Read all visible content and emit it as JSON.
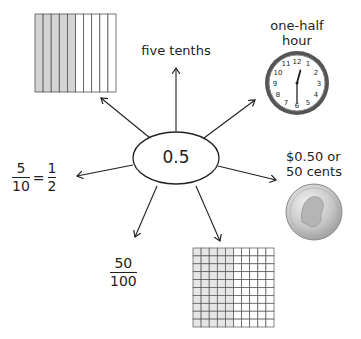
{
  "center": {
    "label": "0.5"
  },
  "nodes": {
    "tenths_grid": {
      "columns": 10,
      "shaded_columns": 5,
      "shade_color": "#d4d4d4"
    },
    "words": {
      "label": "five tenths"
    },
    "clock": {
      "title_line1": "one-half",
      "title_line2": "hour",
      "time": "12:30",
      "numerals": [
        "12",
        "1",
        "2",
        "3",
        "4",
        "5",
        "6",
        "7",
        "8",
        "9",
        "10",
        "11"
      ]
    },
    "money": {
      "line1": "$0.50 or",
      "line2": "50 cents",
      "coin": "half-dollar",
      "coin_year": "1976"
    },
    "hundredths_grid": {
      "rows": 10,
      "columns": 10,
      "shaded_columns": 5,
      "shade_color": "#e6e6e6"
    },
    "fraction_hundredths": {
      "numerator": "50",
      "denominator": "100"
    },
    "equivalent_fractions": {
      "left_num": "5",
      "left_den": "10",
      "equals": "=",
      "right_num": "1",
      "right_den": "2"
    }
  }
}
